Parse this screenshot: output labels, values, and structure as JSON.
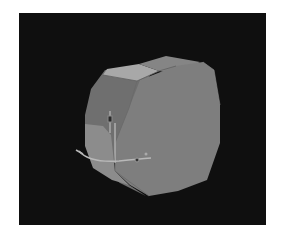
{
  "viewport": {
    "background": "#0f0f0f",
    "object": {
      "type": "octagonal-prism",
      "front_face_color": "#7d7d7d",
      "side_face_color": "#8a8a8a",
      "top_face_highlight": "#a9a9a9",
      "left_face_color": "#6e6e6e"
    },
    "gizmo": {
      "type": "transform-gizmo",
      "color": "#b5b5b5"
    }
  }
}
